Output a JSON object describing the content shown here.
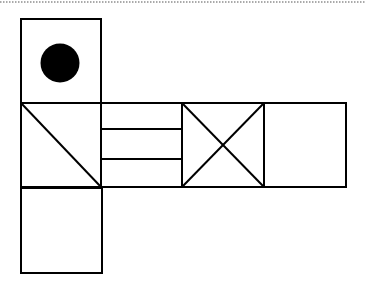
{
  "diagram": {
    "type": "cube-net",
    "colors": {
      "stroke": "#000000",
      "background": "#ffffff",
      "dot": "#000000",
      "dotted_rule": "#555555"
    },
    "faces": [
      {
        "id": "top",
        "pattern": "filled-circle"
      },
      {
        "id": "left",
        "pattern": "diagonal"
      },
      {
        "id": "center",
        "pattern": "two-horizontal-lines"
      },
      {
        "id": "right-1",
        "pattern": "x-cross"
      },
      {
        "id": "right-2",
        "pattern": "blank"
      },
      {
        "id": "bottom",
        "pattern": "blank"
      }
    ]
  }
}
